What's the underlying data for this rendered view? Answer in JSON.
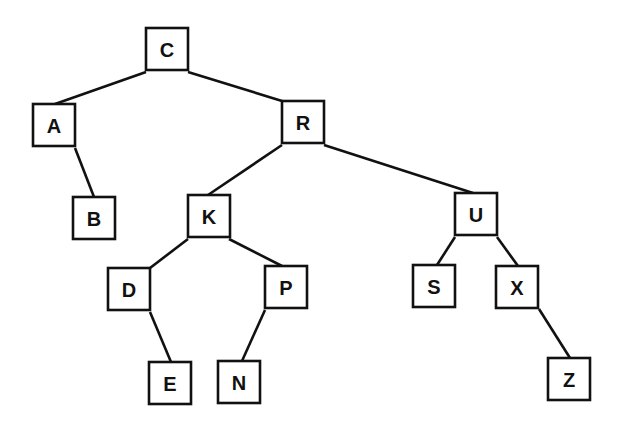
{
  "diagram": {
    "type": "binary-search-tree",
    "root": "C",
    "nodes": [
      {
        "id": "C",
        "label": "C",
        "x": 146,
        "y": 28
      },
      {
        "id": "A",
        "label": "A",
        "x": 33,
        "y": 104
      },
      {
        "id": "R",
        "label": "R",
        "x": 282,
        "y": 101
      },
      {
        "id": "B",
        "label": "B",
        "x": 73,
        "y": 197
      },
      {
        "id": "K",
        "label": "K",
        "x": 188,
        "y": 195
      },
      {
        "id": "U",
        "label": "U",
        "x": 455,
        "y": 193
      },
      {
        "id": "D",
        "label": "D",
        "x": 108,
        "y": 268
      },
      {
        "id": "P",
        "label": "P",
        "x": 265,
        "y": 266
      },
      {
        "id": "S",
        "label": "S",
        "x": 413,
        "y": 265
      },
      {
        "id": "X",
        "label": "X",
        "x": 496,
        "y": 266
      },
      {
        "id": "E",
        "label": "E",
        "x": 149,
        "y": 362
      },
      {
        "id": "N",
        "label": "N",
        "x": 218,
        "y": 361
      },
      {
        "id": "Z",
        "label": "Z",
        "x": 548,
        "y": 358
      }
    ],
    "edges": [
      {
        "from": "C",
        "to": "A",
        "x1": 146,
        "y1": 72,
        "x2": 55,
        "y2": 104
      },
      {
        "from": "C",
        "to": "R",
        "x1": 188,
        "y1": 72,
        "x2": 282,
        "y2": 101
      },
      {
        "from": "A",
        "to": "B",
        "x1": 75,
        "y1": 148,
        "x2": 94,
        "y2": 197
      },
      {
        "from": "R",
        "to": "K",
        "x1": 282,
        "y1": 145,
        "x2": 208,
        "y2": 195
      },
      {
        "from": "R",
        "to": "U",
        "x1": 324,
        "y1": 145,
        "x2": 473,
        "y2": 193
      },
      {
        "from": "K",
        "to": "D",
        "x1": 188,
        "y1": 239,
        "x2": 150,
        "y2": 268
      },
      {
        "from": "K",
        "to": "P",
        "x1": 229,
        "y1": 239,
        "x2": 282,
        "y2": 266
      },
      {
        "from": "U",
        "to": "S",
        "x1": 455,
        "y1": 237,
        "x2": 437,
        "y2": 265
      },
      {
        "from": "U",
        "to": "X",
        "x1": 497,
        "y1": 237,
        "x2": 518,
        "y2": 266
      },
      {
        "from": "D",
        "to": "E",
        "x1": 150,
        "y1": 312,
        "x2": 171,
        "y2": 362
      },
      {
        "from": "P",
        "to": "N",
        "x1": 265,
        "y1": 310,
        "x2": 242,
        "y2": 361
      },
      {
        "from": "X",
        "to": "Z",
        "x1": 539,
        "y1": 309,
        "x2": 570,
        "y2": 358
      }
    ],
    "box_size": 42
  }
}
